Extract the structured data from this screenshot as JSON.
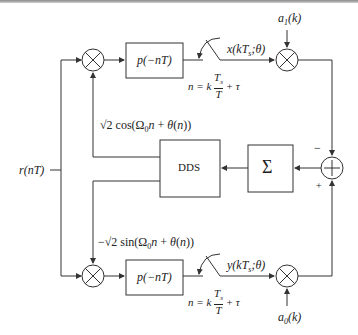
{
  "diagram": {
    "input": {
      "label": "r(nT)"
    },
    "top_branch": {
      "filter_label": "p(−nT)",
      "sampler_output_label": "x(kT_s;θ)",
      "sampling_rule": {
        "lhs": "n = k",
        "num": "T_s",
        "den": "T",
        "rhs": "+ τ"
      },
      "symbol_input_label": "a_1(k)",
      "carrier_label": "√2 cos(Ω0n + θ(n))"
    },
    "bottom_branch": {
      "filter_label": "p(−nT)",
      "sampler_output_label": "y(kT_s;θ)",
      "sampling_rule": {
        "lhs": "n = k",
        "num": "T_s",
        "den": "T",
        "rhs": "+ τ"
      },
      "symbol_input_label": "a_0(k)",
      "carrier_label": "−√2 sin(Ω0n + θ(n))"
    },
    "dds": {
      "label": "DDS"
    },
    "accumulator": {
      "label": "Σ"
    },
    "summer": {
      "minus_sign": "−",
      "plus_sign": "+"
    },
    "line_color": "#333333"
  }
}
